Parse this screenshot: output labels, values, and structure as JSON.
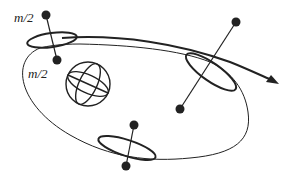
{
  "diagram": {
    "type": "orbital dumbbell satellite diagram",
    "labels": {
      "upper_mass": "m/2",
      "lower_mass": "m/2"
    },
    "elements": {
      "central_body": "planet sphere with latitude/longitude grid",
      "orbit": "elliptical orbit",
      "trajectory_arrow": "curved arrow indicating direction of motion",
      "satellites": [
        {
          "position": "top-left",
          "description": "dumbbell with two masses and elongated body"
        },
        {
          "position": "right",
          "description": "dumbbell tilted, crossing orbit"
        },
        {
          "position": "bottom",
          "description": "dumbbell nearly vertical"
        }
      ]
    },
    "colors": {
      "line": "#222222",
      "background": "#ffffff"
    }
  }
}
